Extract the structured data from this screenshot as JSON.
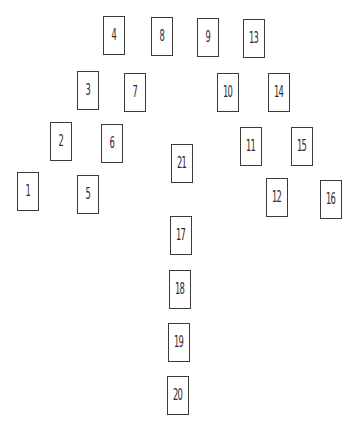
{
  "diagram": {
    "title": "",
    "cards": [
      {
        "label": "1",
        "x": 17,
        "y": 172
      },
      {
        "label": "2",
        "x": 50,
        "y": 122
      },
      {
        "label": "3",
        "x": 77,
        "y": 71
      },
      {
        "label": "4",
        "x": 103,
        "y": 16
      },
      {
        "label": "5",
        "x": 77,
        "y": 175
      },
      {
        "label": "6",
        "x": 101,
        "y": 124
      },
      {
        "label": "7",
        "x": 124,
        "y": 73
      },
      {
        "label": "8",
        "x": 151,
        "y": 17
      },
      {
        "label": "9",
        "x": 197,
        "y": 18
      },
      {
        "label": "10",
        "x": 217,
        "y": 73
      },
      {
        "label": "11",
        "x": 240,
        "y": 127
      },
      {
        "label": "12",
        "x": 266,
        "y": 178
      },
      {
        "label": "13",
        "x": 243,
        "y": 19
      },
      {
        "label": "14",
        "x": 268,
        "y": 73
      },
      {
        "label": "15",
        "x": 291,
        "y": 127
      },
      {
        "label": "16",
        "x": 320,
        "y": 180
      },
      {
        "label": "17",
        "x": 170,
        "y": 216
      },
      {
        "label": "18",
        "x": 169,
        "y": 270
      },
      {
        "label": "19",
        "x": 168,
        "y": 323
      },
      {
        "label": "20",
        "x": 167,
        "y": 376
      },
      {
        "label": "21",
        "x": 171,
        "y": 144
      }
    ]
  }
}
